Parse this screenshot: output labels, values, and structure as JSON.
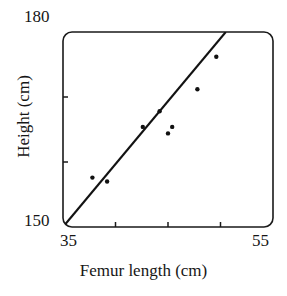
{
  "chart_data": {
    "type": "scatter",
    "title": "",
    "xlabel": "Femur length (cm)",
    "ylabel": "Height (cm)",
    "xlim": [
      35,
      55
    ],
    "ylim": [
      150,
      180
    ],
    "xticks": [
      35,
      55
    ],
    "yticks": [
      150,
      180
    ],
    "xtick_labels": [
      "35",
      "55"
    ],
    "ytick_labels": [
      "150",
      "180"
    ],
    "minor_xticks": [
      40,
      45,
      50
    ],
    "minor_yticks": [
      160,
      170
    ],
    "grid": false,
    "legend": null,
    "frame": "rounded-box",
    "x": [
      37.8,
      39.2,
      42.6,
      44.2,
      45.4,
      45.0,
      47.8,
      49.6
    ],
    "y": [
      157.6,
      157.0,
      165.4,
      167.8,
      165.4,
      164.4,
      171.2,
      176.2
    ],
    "series": [
      {
        "name": "Observations",
        "marker": "dot",
        "color": "#111111",
        "points": [
          {
            "x": 37.8,
            "y": 157.6
          },
          {
            "x": 39.2,
            "y": 157.0
          },
          {
            "x": 42.6,
            "y": 165.4
          },
          {
            "x": 44.2,
            "y": 167.8
          },
          {
            "x": 45.4,
            "y": 165.4
          },
          {
            "x": 45.0,
            "y": 164.4
          },
          {
            "x": 47.8,
            "y": 171.2
          },
          {
            "x": 49.6,
            "y": 176.2
          }
        ]
      },
      {
        "name": "Fitted line",
        "type": "line",
        "color": "#121212",
        "endpoints": [
          {
            "x": 35.0,
            "y": 150.0
          },
          {
            "x": 50.5,
            "y": 180.0
          }
        ]
      }
    ],
    "annotations": []
  },
  "axes": {
    "y_max_label": "180",
    "y_min_label": "150",
    "x_min_label": "35",
    "x_max_label": "55",
    "x_title": "Femur length (cm)",
    "y_title": "Height (cm)"
  },
  "colors": {
    "ink": "#1a1a1a",
    "point": "#111111",
    "line": "#121212",
    "background": "#ffffff"
  }
}
